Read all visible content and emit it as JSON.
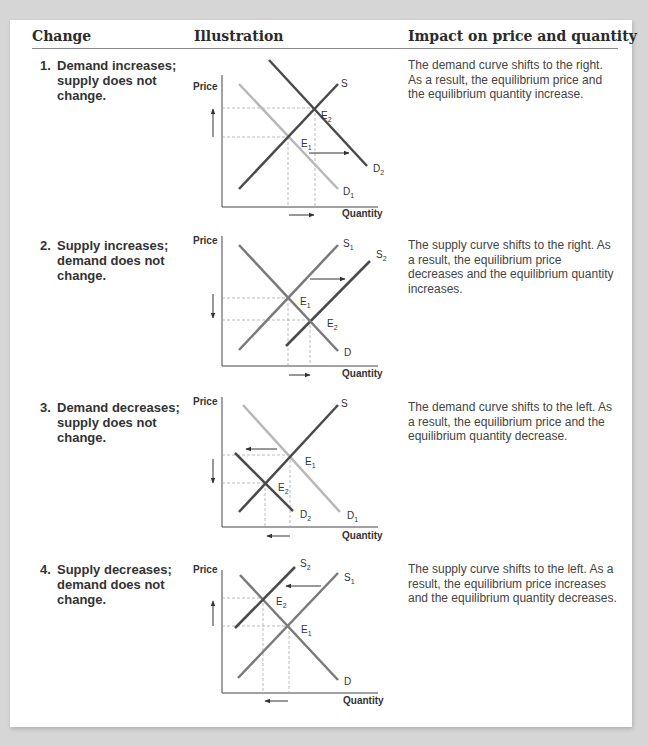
{
  "header": {
    "col_change": "Change",
    "col_illustration": "Illustration",
    "col_impact": "Impact on price and quantity"
  },
  "rows": [
    {
      "num": "1.",
      "change": "Demand increases; supply does not change.",
      "impact": "The demand curve shifts to the right. As a result, the equilibrium price and the equilibrium quantity increase.",
      "chart": {
        "y_label": "Price",
        "x_label": "Quantity",
        "curves": [
          {
            "label": "D",
            "sub": "1",
            "shade": "light"
          },
          {
            "label": "S",
            "sub": "",
            "shade": "dark"
          },
          {
            "label": "D",
            "sub": "2",
            "shade": "dark"
          }
        ],
        "points": [
          {
            "label": "E",
            "sub": "1"
          },
          {
            "label": "E",
            "sub": "2"
          }
        ],
        "shift_arrow": "right",
        "price_arrow": "up",
        "quantity_arrow": "right"
      }
    },
    {
      "num": "2.",
      "change": "Supply increases; demand does not change.",
      "impact": "The supply curve shifts to the right. As a result, the equilibrium price decreases and the equilibrium quantity increases.",
      "chart": {
        "y_label": "Price",
        "x_label": "Quantity",
        "curves": [
          {
            "label": "S",
            "sub": "1",
            "shade": "medium"
          },
          {
            "label": "S",
            "sub": "2",
            "shade": "dark"
          },
          {
            "label": "D",
            "sub": "",
            "shade": "medium"
          }
        ],
        "points": [
          {
            "label": "E",
            "sub": "1"
          },
          {
            "label": "E",
            "sub": "2"
          }
        ],
        "shift_arrow": "right",
        "price_arrow": "down",
        "quantity_arrow": "right"
      }
    },
    {
      "num": "3.",
      "change": "Demand decreases; supply does not change.",
      "impact": "The demand curve shifts to the left. As a result, the equilibrium price and the equilibrium quantity decrease.",
      "chart": {
        "y_label": "Price",
        "x_label": "Quantity",
        "curves": [
          {
            "label": "S",
            "sub": "",
            "shade": "dark"
          },
          {
            "label": "D",
            "sub": "1",
            "shade": "light"
          },
          {
            "label": "D",
            "sub": "2",
            "shade": "dark"
          }
        ],
        "points": [
          {
            "label": "E",
            "sub": "1"
          },
          {
            "label": "E",
            "sub": "2"
          }
        ],
        "shift_arrow": "left",
        "price_arrow": "down",
        "quantity_arrow": "left"
      }
    },
    {
      "num": "4.",
      "change": "Supply decreases; demand does not change.",
      "impact": "The supply curve shifts to the left. As a result, the equilibrium price increases and the equilibrium quantity decreases.",
      "chart": {
        "y_label": "Price",
        "x_label": "Quantity",
        "curves": [
          {
            "label": "S",
            "sub": "2",
            "shade": "dark"
          },
          {
            "label": "S",
            "sub": "1",
            "shade": "medium"
          },
          {
            "label": "D",
            "sub": "",
            "shade": "medium"
          }
        ],
        "points": [
          {
            "label": "E",
            "sub": "2"
          },
          {
            "label": "E",
            "sub": "1"
          }
        ],
        "shift_arrow": "left",
        "price_arrow": "up",
        "quantity_arrow": "left"
      }
    }
  ],
  "colors": {
    "dark": "#4a4a4a",
    "medium": "#7a7a7a",
    "light": "#b8b8b8",
    "axis": "#444444",
    "guide": "#aaaaaa"
  }
}
